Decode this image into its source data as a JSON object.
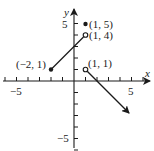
{
  "chart_data": {
    "type": "line",
    "title": "",
    "xlabel": "x",
    "ylabel": "y",
    "xlim": [
      -6.5,
      6.5
    ],
    "ylim": [
      -6,
      6
    ],
    "grid": false,
    "x_ticks": [
      -6,
      -5,
      -4,
      -3,
      -2,
      -1,
      1,
      2,
      3,
      4,
      5,
      6
    ],
    "y_ticks": [
      -6,
      -5,
      -4,
      -3,
      -2,
      -1,
      1,
      2,
      3,
      4,
      5
    ],
    "x_tick_labels": [
      {
        "value": -5,
        "label": "−5"
      },
      {
        "value": 5,
        "label": "5"
      }
    ],
    "y_tick_labels": [
      {
        "value": 5,
        "label": "5"
      },
      {
        "value": -5,
        "label": "−5"
      }
    ],
    "series": [
      {
        "name": "segment",
        "kind": "segment",
        "points": [
          [
            -2,
            1
          ],
          [
            1,
            4
          ]
        ],
        "endpoints": [
          {
            "x": -2,
            "y": 1,
            "style": "closed",
            "label": "(−2, 1)"
          },
          {
            "x": 1,
            "y": 4,
            "style": "open",
            "label": "(1, 4)"
          }
        ]
      },
      {
        "name": "isolated-point",
        "kind": "point",
        "points": [
          [
            1,
            5
          ]
        ],
        "endpoints": [
          {
            "x": 1,
            "y": 5,
            "style": "closed",
            "label": "(1, 5)"
          }
        ]
      },
      {
        "name": "ray",
        "kind": "ray",
        "points": [
          [
            1,
            1
          ],
          [
            4.8,
            -2.8
          ]
        ],
        "slope": -1,
        "endpoints": [
          {
            "x": 1,
            "y": 1,
            "style": "open",
            "label": "(1, 1)"
          }
        ]
      }
    ],
    "colors": {
      "ink": "#1a1a1a",
      "background": "#ffffff"
    }
  },
  "labels": {
    "x_axis": "x",
    "y_axis": "y",
    "x_neg5": "−5",
    "x_pos5": "5",
    "y_pos5": "5",
    "y_neg5": "−5",
    "pt_m2_1": "(−2, 1)",
    "pt_1_4": "(1, 4)",
    "pt_1_5": "(1, 5)",
    "pt_1_1": "(1, 1)"
  }
}
